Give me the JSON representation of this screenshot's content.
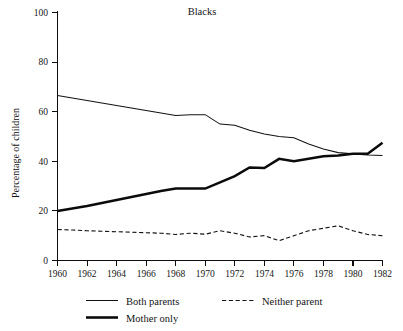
{
  "chart_data": {
    "type": "line",
    "title": "Blacks",
    "xlabel": "",
    "ylabel": "Percentage of children",
    "xlim": [
      1960,
      1982
    ],
    "ylim": [
      0,
      100
    ],
    "grid": false,
    "legend_position": "below-axes",
    "x": [
      1960,
      1961,
      1962,
      1963,
      1964,
      1965,
      1966,
      1967,
      1968,
      1969,
      1970,
      1971,
      1972,
      1973,
      1974,
      1975,
      1976,
      1977,
      1978,
      1979,
      1980,
      1981,
      1982
    ],
    "xticks": [
      1960,
      1962,
      1964,
      1966,
      1968,
      1970,
      1972,
      1974,
      1976,
      1978,
      1980,
      1982
    ],
    "xticklabels": [
      "1960",
      "1962",
      "1964",
      "1966",
      "1968",
      "1970",
      "1972",
      "1974",
      "1976",
      "1978",
      "1980",
      "1982"
    ],
    "yticks": [
      0,
      20,
      40,
      60,
      80,
      100
    ],
    "yticklabels": [
      "0",
      "20",
      "40",
      "60",
      "80",
      "100"
    ],
    "series": [
      {
        "name": "Both parents",
        "style": "thin-solid",
        "values": [
          66.5,
          65.5,
          64.5,
          63.5,
          62.5,
          61.5,
          60.5,
          59.5,
          58.5,
          58.8,
          58.8,
          55.0,
          54.5,
          52.5,
          51.0,
          50.0,
          49.5,
          47.0,
          45.0,
          43.5,
          43.0,
          42.5,
          42.3
        ]
      },
      {
        "name": "Mother only",
        "style": "thick-solid",
        "values": [
          20.0,
          21.0,
          22.0,
          23.2,
          24.4,
          25.6,
          26.8,
          28.0,
          29.0,
          29.0,
          29.0,
          31.5,
          34.0,
          37.5,
          37.3,
          41.0,
          40.0,
          41.0,
          42.0,
          42.3,
          43.0,
          43.0,
          47.5
        ]
      },
      {
        "name": "Neither parent",
        "style": "dashed",
        "values": [
          12.5,
          12.3,
          12.0,
          11.8,
          11.6,
          11.4,
          11.2,
          11.0,
          10.5,
          11.0,
          10.6,
          12.0,
          11.0,
          9.5,
          10.0,
          8.0,
          10.0,
          12.0,
          13.0,
          14.0,
          12.0,
          10.5,
          10.0
        ]
      }
    ],
    "legend": [
      {
        "label": "Both parents",
        "style": "thin-solid"
      },
      {
        "label": "Neither parent",
        "style": "dashed"
      },
      {
        "label": "Mother only",
        "style": "thick-solid"
      }
    ]
  }
}
